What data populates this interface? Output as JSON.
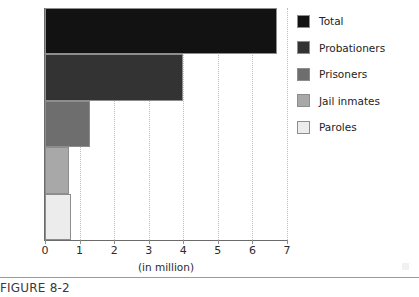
{
  "chart_data": {
    "type": "bar",
    "orientation": "horizontal",
    "title": "",
    "xlabel": "(in million)",
    "ylabel": "",
    "xlim": [
      0,
      7
    ],
    "xticks": [
      0,
      1,
      2,
      3,
      4,
      5,
      6,
      7
    ],
    "xtick_labels": [
      "0",
      "1",
      "2",
      "3",
      "4",
      "5",
      "6",
      "7"
    ],
    "grid": "vertical-dotted",
    "legend_position": "right",
    "categories": [
      "Total",
      "Probationers",
      "Prisoners",
      "Jail inmates",
      "Paroles"
    ],
    "values": [
      6.7,
      4.0,
      1.3,
      0.7,
      0.75
    ],
    "colors": [
      "#121212",
      "#333333",
      "#6e6e6e",
      "#a8a8a8",
      "#ececec"
    ],
    "series": [
      {
        "name": "Correctional population",
        "units": "million",
        "points": [
          {
            "label": "Total",
            "value": 6.7,
            "color": "#121212"
          },
          {
            "label": "Probationers",
            "value": 4.0,
            "color": "#333333"
          },
          {
            "label": "Prisoners",
            "value": 1.3,
            "color": "#6e6e6e"
          },
          {
            "label": "Jail inmates",
            "value": 0.7,
            "color": "#a8a8a8"
          },
          {
            "label": "Paroles",
            "value": 0.75,
            "color": "#ececec"
          }
        ]
      }
    ]
  },
  "legend": {
    "items": [
      {
        "label": "Total",
        "color": "#121212"
      },
      {
        "label": "Probationers",
        "color": "#333333"
      },
      {
        "label": "Prisoners",
        "color": "#6e6e6e"
      },
      {
        "label": "Jail inmates",
        "color": "#a8a8a8"
      },
      {
        "label": "Paroles",
        "color": "#ececec"
      }
    ]
  },
  "axis": {
    "x_label": "(in million)",
    "tick_labels": [
      "0",
      "1",
      "2",
      "3",
      "4",
      "5",
      "6",
      "7"
    ]
  },
  "caption": {
    "text": "FIGURE 8-2"
  }
}
